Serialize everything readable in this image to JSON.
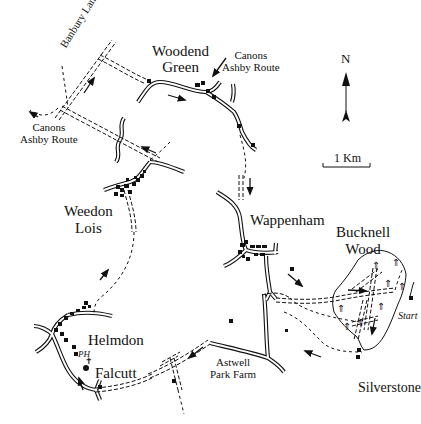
{
  "map": {
    "type": "walking route sketch map",
    "compass": {
      "label": "N"
    },
    "scale_bar": {
      "label": "1 Km"
    },
    "places": {
      "woodend_green": [
        "Woodend",
        "Green"
      ],
      "weedon_lois": [
        "Weedon",
        "Lois"
      ],
      "wappenham": "Wappenham",
      "bucknell_wood": [
        "Bucknell",
        "Wood"
      ],
      "helmdon": "Helmdon",
      "falcutt": "Falcutt",
      "astwell_park_farm": [
        "Astwell",
        "Park Farm"
      ],
      "silverstone": "Silverstone"
    },
    "roads": {
      "banbury_lane": "Banbury Lane"
    },
    "route_labels": {
      "canons_ashby_top": [
        "Canons",
        "Ashby Route"
      ],
      "canons_ashby_left": [
        "Canons",
        "Ashby Route"
      ]
    },
    "markers": {
      "start": "Start",
      "pub": "PH"
    },
    "colors": {
      "ink": "#111111",
      "background": "#ffffff"
    }
  }
}
